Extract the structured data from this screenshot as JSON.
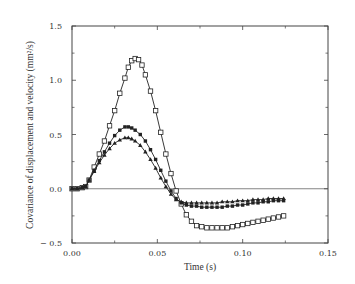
{
  "chart_data": {
    "type": "line",
    "title": "",
    "xlabel": "Time (s)",
    "ylabel": "Covariance of displacement and velocity (mm²/s)",
    "xlim": [
      0.0,
      0.15
    ],
    "ylim": [
      -0.5,
      1.5
    ],
    "xticks": [
      "0.00",
      "0.05",
      "0.10",
      "0.15"
    ],
    "yticks": [
      "-0.5",
      "0.0",
      "0.5",
      "1.0",
      "1.5"
    ],
    "grid": false,
    "legend": null,
    "zero_line": true,
    "series": [
      {
        "name": "open-square",
        "marker": "open-square",
        "x": [
          0.0,
          0.003,
          0.006,
          0.008,
          0.01,
          0.013,
          0.016,
          0.019,
          0.022,
          0.025,
          0.028,
          0.031,
          0.033,
          0.035,
          0.037,
          0.039,
          0.041,
          0.043,
          0.046,
          0.049,
          0.052,
          0.055,
          0.058,
          0.061,
          0.064,
          0.067,
          0.07,
          0.073,
          0.076,
          0.079,
          0.082,
          0.085,
          0.088,
          0.091,
          0.094,
          0.097,
          0.1,
          0.103,
          0.106,
          0.109,
          0.112,
          0.115,
          0.118,
          0.121,
          0.124
        ],
        "y": [
          0.0,
          0.0,
          0.01,
          0.02,
          0.08,
          0.2,
          0.32,
          0.44,
          0.58,
          0.72,
          0.88,
          1.02,
          1.12,
          1.18,
          1.2,
          1.19,
          1.14,
          1.05,
          0.9,
          0.72,
          0.52,
          0.32,
          0.14,
          -0.02,
          -0.14,
          -0.24,
          -0.3,
          -0.34,
          -0.35,
          -0.36,
          -0.36,
          -0.36,
          -0.36,
          -0.36,
          -0.35,
          -0.34,
          -0.33,
          -0.32,
          -0.31,
          -0.3,
          -0.29,
          -0.28,
          -0.27,
          -0.26,
          -0.25
        ]
      },
      {
        "name": "filled-square",
        "marker": "filled-square",
        "x": [
          0.0,
          0.003,
          0.006,
          0.008,
          0.01,
          0.013,
          0.016,
          0.019,
          0.022,
          0.025,
          0.028,
          0.031,
          0.033,
          0.035,
          0.037,
          0.04,
          0.043,
          0.046,
          0.049,
          0.052,
          0.055,
          0.058,
          0.061,
          0.064,
          0.067,
          0.07,
          0.073,
          0.076,
          0.079,
          0.082,
          0.085,
          0.088,
          0.091,
          0.094,
          0.097,
          0.1,
          0.103,
          0.106,
          0.109,
          0.112,
          0.115,
          0.118,
          0.121,
          0.124
        ],
        "y": [
          0.0,
          0.0,
          0.01,
          0.02,
          0.08,
          0.17,
          0.26,
          0.34,
          0.42,
          0.49,
          0.54,
          0.57,
          0.57,
          0.56,
          0.54,
          0.5,
          0.44,
          0.36,
          0.27,
          0.17,
          0.07,
          -0.02,
          -0.09,
          -0.13,
          -0.15,
          -0.16,
          -0.16,
          -0.17,
          -0.17,
          -0.17,
          -0.17,
          -0.17,
          -0.16,
          -0.16,
          -0.15,
          -0.15,
          -0.14,
          -0.13,
          -0.13,
          -0.12,
          -0.12,
          -0.11,
          -0.11,
          -0.11
        ]
      },
      {
        "name": "filled-triangle",
        "marker": "filled-triangle",
        "x": [
          0.0,
          0.003,
          0.006,
          0.008,
          0.01,
          0.013,
          0.016,
          0.019,
          0.022,
          0.025,
          0.028,
          0.031,
          0.033,
          0.035,
          0.037,
          0.04,
          0.043,
          0.046,
          0.049,
          0.052,
          0.055,
          0.058,
          0.061,
          0.064,
          0.067,
          0.07,
          0.073,
          0.076,
          0.079,
          0.082,
          0.085,
          0.088,
          0.091,
          0.094,
          0.097,
          0.1,
          0.103,
          0.106,
          0.109,
          0.112,
          0.115,
          0.118,
          0.121,
          0.124
        ],
        "y": [
          0.0,
          0.0,
          0.01,
          0.02,
          0.08,
          0.16,
          0.24,
          0.31,
          0.37,
          0.42,
          0.45,
          0.47,
          0.47,
          0.46,
          0.44,
          0.4,
          0.34,
          0.27,
          0.19,
          0.1,
          0.02,
          -0.05,
          -0.1,
          -0.12,
          -0.13,
          -0.13,
          -0.13,
          -0.13,
          -0.13,
          -0.13,
          -0.13,
          -0.12,
          -0.12,
          -0.12,
          -0.11,
          -0.11,
          -0.11,
          -0.1,
          -0.1,
          -0.1,
          -0.09,
          -0.09,
          -0.09,
          -0.09
        ]
      }
    ]
  },
  "colors": {
    "line": "#222222",
    "axis": "#444444",
    "zero_line": "#666666"
  }
}
